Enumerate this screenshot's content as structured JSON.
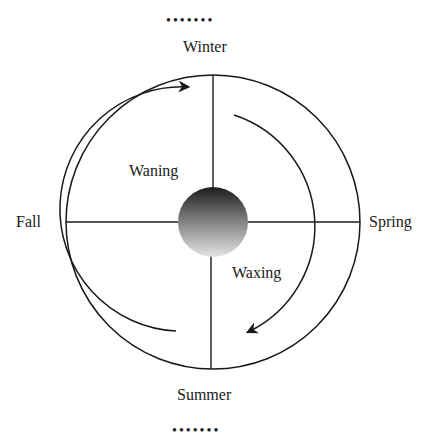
{
  "diagram": {
    "labels": {
      "top": "Winter",
      "bottom": "Summer",
      "left": "Fall",
      "right": "Spring",
      "left_arc": "Waning",
      "right_arc": "Waxing"
    },
    "ornament_top": "•••••••",
    "ornament_bottom": "•••••••",
    "colors": {
      "line": "#1a1a1a",
      "sphere_dark": "#1c1c1c",
      "sphere_light": "#e0e0e0",
      "background": "#ffffff"
    }
  }
}
